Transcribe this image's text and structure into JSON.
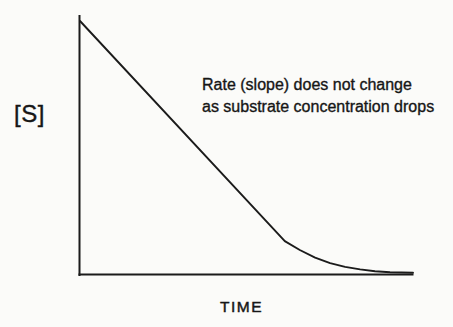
{
  "chart_data": {
    "type": "line",
    "title": "",
    "xlabel": "TIME",
    "ylabel": "[S]",
    "annotation": [
      "Rate (slope) does not change",
      "as substrate concentration drops"
    ],
    "x_range": [
      0,
      1
    ],
    "y_range": [
      0,
      1
    ],
    "grid": false,
    "legend": "none",
    "series": [
      {
        "name": "substrate-concentration",
        "x": [
          0,
          0.615,
          0.66,
          0.706,
          0.751,
          0.796,
          0.841,
          0.886,
          0.931,
          1.0
        ],
        "y": [
          1.0,
          0.13,
          0.095,
          0.065,
          0.043,
          0.028,
          0.018,
          0.011,
          0.007,
          0.005
        ]
      }
    ]
  },
  "labels": {
    "y_axis": "[S]",
    "x_axis": "TIME",
    "annotation_line1": "Rate (slope) does not change",
    "annotation_line2": "as substrate concentration drops"
  },
  "colors": {
    "background": "#fbfbf9",
    "line": "#1b1b1b",
    "text": "#161616"
  }
}
